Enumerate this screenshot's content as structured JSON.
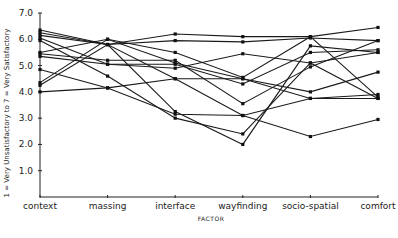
{
  "chart_data": {
    "type": "line",
    "title": "",
    "xlabel": "FACTOR",
    "ylabel": "1 = Very Unsatisfactory to 7 = Very Satisfactory",
    "categories": [
      "context",
      "massing",
      "interface",
      "wayfinding",
      "socio-spatial",
      "comfort"
    ],
    "yticks": [
      "1.0",
      "2.0",
      "3.0",
      "4.0",
      "5.0",
      "6.0",
      "7.0"
    ],
    "ylim": [
      0,
      7
    ],
    "grid": false,
    "legend": "none",
    "series": [
      {
        "name": "s1",
        "values": [
          6.35,
          5.8,
          6.2,
          6.1,
          6.1,
          6.45
        ]
      },
      {
        "name": "s2",
        "values": [
          6.25,
          5.8,
          5.95,
          5.9,
          6.05,
          5.95
        ]
      },
      {
        "name": "s3",
        "values": [
          6.15,
          5.8,
          3.25,
          2.0,
          5.75,
          5.5
        ]
      },
      {
        "name": "s4",
        "values": [
          6.05,
          5.05,
          5.05,
          4.3,
          5.5,
          5.6
        ]
      },
      {
        "name": "s5",
        "values": [
          5.95,
          4.6,
          3.0,
          2.4,
          5.1,
          3.75
        ]
      },
      {
        "name": "s6",
        "values": [
          5.5,
          6.0,
          5.5,
          4.55,
          6.1,
          3.8
        ]
      },
      {
        "name": "s7",
        "values": [
          5.45,
          5.2,
          5.2,
          3.55,
          4.95,
          5.95
        ]
      },
      {
        "name": "s8",
        "values": [
          5.35,
          5.05,
          4.9,
          5.45,
          5.1,
          5.5
        ]
      },
      {
        "name": "s9",
        "values": [
          4.85,
          4.15,
          3.15,
          3.1,
          3.75,
          3.9
        ]
      },
      {
        "name": "s10",
        "values": [
          4.35,
          6.0,
          5.1,
          4.5,
          4.0,
          4.75
        ]
      },
      {
        "name": "s11",
        "values": [
          4.25,
          5.8,
          4.5,
          3.1,
          2.3,
          2.95
        ]
      },
      {
        "name": "s12",
        "values": [
          4.0,
          4.15,
          4.5,
          4.5,
          3.75,
          3.75
        ]
      }
    ]
  }
}
